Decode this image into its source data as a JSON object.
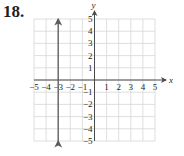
{
  "problem_number": "18.",
  "chart_data": {
    "type": "line",
    "title": "",
    "xlabel": "x",
    "ylabel": "y",
    "xlim": [
      -5,
      5
    ],
    "ylim": [
      -5,
      5
    ],
    "grid": true,
    "x_ticks": [
      "-5",
      "-4",
      "-3",
      "-2",
      "-1",
      "1",
      "2",
      "3",
      "4",
      "5"
    ],
    "y_ticks": [
      "5",
      "4",
      "3",
      "2",
      "1",
      "-1",
      "-2",
      "-3",
      "-4",
      "-5"
    ],
    "series": [
      {
        "name": "x = -3",
        "equation": "x = -3",
        "x": [
          -3,
          -3
        ],
        "y": [
          -5,
          5
        ],
        "arrows": "both"
      }
    ]
  },
  "colors": {
    "grid": "#d6d6d6",
    "axis": "#4a4a4a",
    "line": "#5a5a5a",
    "text": "#231f20"
  }
}
